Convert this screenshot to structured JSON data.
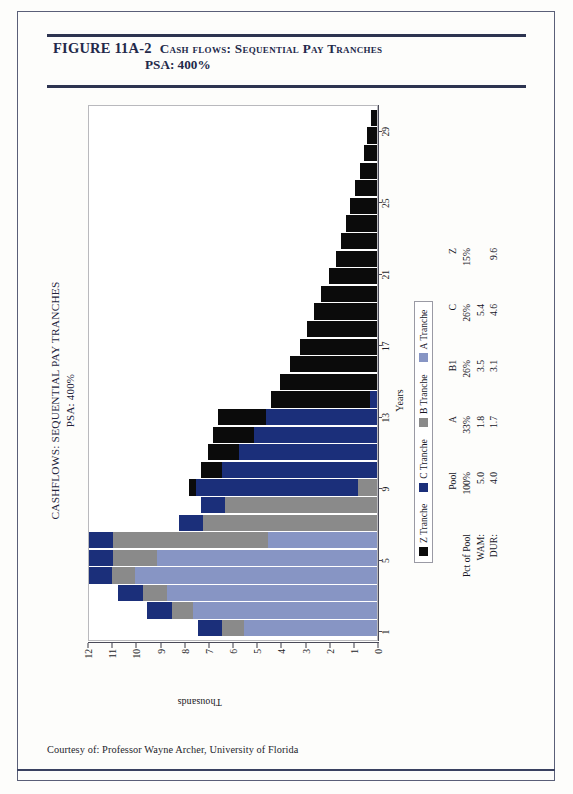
{
  "figure": {
    "number": "FIGURE 11A-2",
    "title": "Cash flows: Sequential Pay Tranches",
    "subtitle": "PSA: 400%"
  },
  "footer": {
    "credit": "Courtesy of: Professor Wayne Archer, University of Florida"
  },
  "chart_data": {
    "type": "bar",
    "stacked": true,
    "orientation": "rotated-90",
    "title": "CASHFLOWS: SEQUENTIAL PAY TRANCHES",
    "subtitle": "PSA: 400%",
    "xlabel": "Years",
    "ylabel": "Thousands",
    "ylim": [
      0,
      12
    ],
    "yticks": [
      0,
      1,
      2,
      3,
      4,
      5,
      6,
      7,
      8,
      9,
      10,
      11,
      12
    ],
    "ytick_labels": [
      "0",
      "1",
      "2",
      "3",
      "4",
      "5",
      "6",
      "7",
      "8",
      "9",
      "10",
      "11",
      "12"
    ],
    "xticks": [
      1,
      5,
      9,
      13,
      17,
      21,
      25,
      29
    ],
    "xtick_labels": [
      "1",
      "5",
      "9",
      "13",
      "17",
      "21",
      "25",
      "29"
    ],
    "grid": false,
    "legend_position": "below-axis",
    "categories": [
      1,
      2,
      3,
      4,
      5,
      6,
      7,
      8,
      9,
      10,
      11,
      12,
      13,
      14,
      15,
      16,
      17,
      18,
      19,
      20,
      21,
      22,
      23,
      24,
      25,
      26,
      27,
      28,
      29,
      30
    ],
    "series": [
      {
        "name": "A Tranche",
        "color": "#8795c4",
        "values": [
          5.5,
          7.6,
          8.7,
          10.6,
          9.3,
          4.6,
          0.0,
          0.0,
          0.0,
          0.0,
          0.0,
          0.0,
          0.0,
          0.0,
          0.0,
          0.0,
          0.0,
          0.0,
          0.0,
          0.0,
          0.0,
          0.0,
          0.0,
          0.0,
          0.0,
          0.0,
          0.0,
          0.0,
          0.0,
          0.0
        ]
      },
      {
        "name": "B Tranche",
        "color": "#8a8a8a",
        "values": [
          0.9,
          0.9,
          1.0,
          1.0,
          1.9,
          6.6,
          7.2,
          6.3,
          0.8,
          0.0,
          0.0,
          0.0,
          0.0,
          0.0,
          0.0,
          0.0,
          0.0,
          0.0,
          0.0,
          0.0,
          0.0,
          0.0,
          0.0,
          0.0,
          0.0,
          0.0,
          0.0,
          0.0,
          0.0,
          0.0
        ]
      },
      {
        "name": "C Tranche",
        "color": "#1b2f7a",
        "values": [
          1.0,
          1.0,
          1.0,
          1.0,
          1.0,
          1.0,
          1.0,
          1.0,
          6.7,
          6.4,
          5.7,
          5.1,
          4.6,
          0.3,
          0.0,
          0.0,
          0.0,
          0.0,
          0.0,
          0.0,
          0.0,
          0.0,
          0.0,
          0.0,
          0.0,
          0.0,
          0.0,
          0.0,
          0.0,
          0.0
        ]
      },
      {
        "name": "Z Tranche",
        "color": "#0b0b0b",
        "values": [
          0.0,
          0.0,
          0.0,
          0.0,
          0.0,
          0.0,
          0.0,
          0.0,
          0.3,
          0.9,
          1.3,
          1.7,
          2.0,
          4.1,
          4.0,
          3.6,
          3.2,
          2.9,
          2.6,
          2.3,
          2.0,
          1.7,
          1.5,
          1.3,
          1.1,
          0.9,
          0.7,
          0.55,
          0.4,
          0.25
        ]
      }
    ]
  },
  "legend": {
    "items": [
      {
        "label": "Z Tranche",
        "color": "#0b0b0b"
      },
      {
        "label": "C Tranche",
        "color": "#1b2f7a"
      },
      {
        "label": "B Tranche",
        "color": "#8a8a8a"
      },
      {
        "label": "A Tranche",
        "color": "#8795c4"
      }
    ]
  },
  "stats": {
    "columns": [
      "Pool",
      "A",
      "B1",
      "C",
      "Z"
    ],
    "rows": [
      {
        "label": "Pct of Pool",
        "values": [
          "100%",
          "33%",
          "26%",
          "26%",
          "15%"
        ]
      },
      {
        "label": "WAM:",
        "values": [
          "5.0",
          "1.8",
          "3.5",
          "5.4",
          ""
        ]
      },
      {
        "label": "DUR:",
        "values": [
          "4.0",
          "1.7",
          "3.1",
          "4.6",
          "9.6"
        ]
      }
    ]
  }
}
